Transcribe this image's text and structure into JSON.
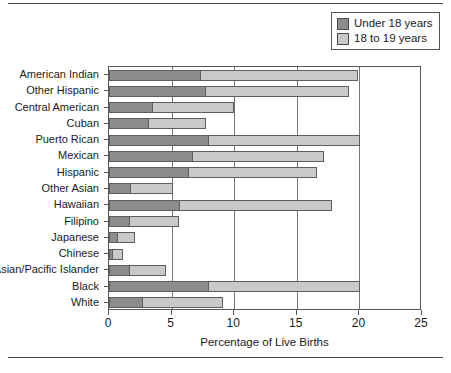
{
  "chart_data": {
    "type": "bar",
    "orientation": "horizontal",
    "stacked": true,
    "title": "",
    "xlabel": "Percentage of Live Births",
    "ylabel": "",
    "xlim": [
      0,
      25
    ],
    "xticks": [
      0,
      5,
      10,
      15,
      20,
      25
    ],
    "grid": "vertical",
    "legend_position": "top-right",
    "categories": [
      "American Indian",
      "Other Hispanic",
      "Central American",
      "Cuban",
      "Puerto Rican",
      "Mexican",
      "Hispanic",
      "Other Asian",
      "Hawaiian",
      "Filipino",
      "Japanese",
      "Chinese",
      "Asian/Pacific Islander",
      "Black",
      "White"
    ],
    "series": [
      {
        "name": "Under 18 years",
        "color": "#8c8c8c",
        "values": [
          7.3,
          7.7,
          3.4,
          3.1,
          7.9,
          6.6,
          6.3,
          1.7,
          5.6,
          1.6,
          0.6,
          0.2,
          1.6,
          7.9,
          2.6
        ]
      },
      {
        "name": "18 to 19 years",
        "color": "#c9c9c9",
        "values": [
          12.5,
          11.4,
          6.5,
          4.6,
          12.1,
          10.5,
          10.2,
          3.3,
          12.1,
          3.9,
          1.4,
          0.8,
          2.9,
          12.1,
          6.4
        ]
      }
    ],
    "totals": [
      19.8,
      19.1,
      9.9,
      7.7,
      20.0,
      17.1,
      16.5,
      5.0,
      17.7,
      5.5,
      2.0,
      1.0,
      4.5,
      20.0,
      9.0
    ]
  },
  "legend": {
    "items": [
      {
        "label": "Under 18 years",
        "color": "#8c8c8c"
      },
      {
        "label": "18 to 19 years",
        "color": "#c9c9c9"
      }
    ]
  },
  "axis": {
    "x_title": "Percentage of Live Births",
    "x_tick_labels": [
      "0",
      "5",
      "10",
      "15",
      "20",
      "25"
    ]
  },
  "colors": {
    "under18": "#8c8c8c",
    "age18to19": "#c9c9c9",
    "frame": "#555555",
    "gridline": "#777777",
    "background": "#ffffff",
    "text": "#1a1a1a"
  }
}
